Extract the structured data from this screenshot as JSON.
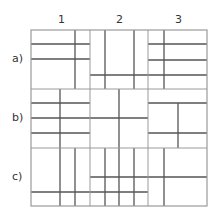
{
  "columns": [
    {
      "label": "1",
      "x": 62
    },
    {
      "label": "2",
      "x": 120
    },
    {
      "label": "3",
      "x": 179
    }
  ],
  "rows": [
    {
      "label": "a)",
      "y": 59
    },
    {
      "label": "b)",
      "y": 118
    },
    {
      "label": "c)",
      "y": 177
    }
  ],
  "colors": {
    "outer": "#9a9a9a",
    "grid": "#555555",
    "text": "#333333"
  },
  "grid": {
    "x0": 31,
    "y0": 30,
    "x1": 207,
    "y1": 206
  },
  "cell_lines": [
    {
      "x1": 90,
      "y1": 30,
      "x2": 90,
      "y2": 206
    },
    {
      "x1": 148,
      "y1": 30,
      "x2": 148,
      "y2": 206
    },
    {
      "x1": 31,
      "y1": 89,
      "x2": 207,
      "y2": 89
    },
    {
      "x1": 31,
      "y1": 148,
      "x2": 207,
      "y2": 148
    }
  ],
  "inner_lines": [
    {
      "x1": 75,
      "y1": 30,
      "x2": 75,
      "y2": 89
    },
    {
      "x1": 31,
      "y1": 44,
      "x2": 90,
      "y2": 44
    },
    {
      "x1": 31,
      "y1": 59,
      "x2": 90,
      "y2": 59
    },
    {
      "x1": 105,
      "y1": 30,
      "x2": 105,
      "y2": 89
    },
    {
      "x1": 134,
      "y1": 30,
      "x2": 134,
      "y2": 89
    },
    {
      "x1": 90,
      "y1": 75,
      "x2": 207,
      "y2": 75
    },
    {
      "x1": 164,
      "y1": 30,
      "x2": 164,
      "y2": 89
    },
    {
      "x1": 148,
      "y1": 44,
      "x2": 207,
      "y2": 44
    },
    {
      "x1": 148,
      "y1": 60,
      "x2": 207,
      "y2": 60
    },
    {
      "x1": 60,
      "y1": 89,
      "x2": 60,
      "y2": 148
    },
    {
      "x1": 31,
      "y1": 103,
      "x2": 90,
      "y2": 103
    },
    {
      "x1": 31,
      "y1": 118,
      "x2": 90,
      "y2": 118
    },
    {
      "x1": 31,
      "y1": 133,
      "x2": 90,
      "y2": 133
    },
    {
      "x1": 119,
      "y1": 89,
      "x2": 119,
      "y2": 148
    },
    {
      "x1": 90,
      "y1": 118,
      "x2": 148,
      "y2": 118
    },
    {
      "x1": 178,
      "y1": 103,
      "x2": 178,
      "y2": 148
    },
    {
      "x1": 148,
      "y1": 103,
      "x2": 207,
      "y2": 103
    },
    {
      "x1": 148,
      "y1": 133,
      "x2": 207,
      "y2": 133
    },
    {
      "x1": 60,
      "y1": 148,
      "x2": 60,
      "y2": 206
    },
    {
      "x1": 75,
      "y1": 148,
      "x2": 75,
      "y2": 206
    },
    {
      "x1": 31,
      "y1": 192,
      "x2": 148,
      "y2": 192
    },
    {
      "x1": 105,
      "y1": 148,
      "x2": 105,
      "y2": 206
    },
    {
      "x1": 119,
      "y1": 148,
      "x2": 119,
      "y2": 206
    },
    {
      "x1": 134,
      "y1": 148,
      "x2": 134,
      "y2": 206
    },
    {
      "x1": 90,
      "y1": 177,
      "x2": 207,
      "y2": 177
    },
    {
      "x1": 164,
      "y1": 148,
      "x2": 164,
      "y2": 206
    }
  ]
}
